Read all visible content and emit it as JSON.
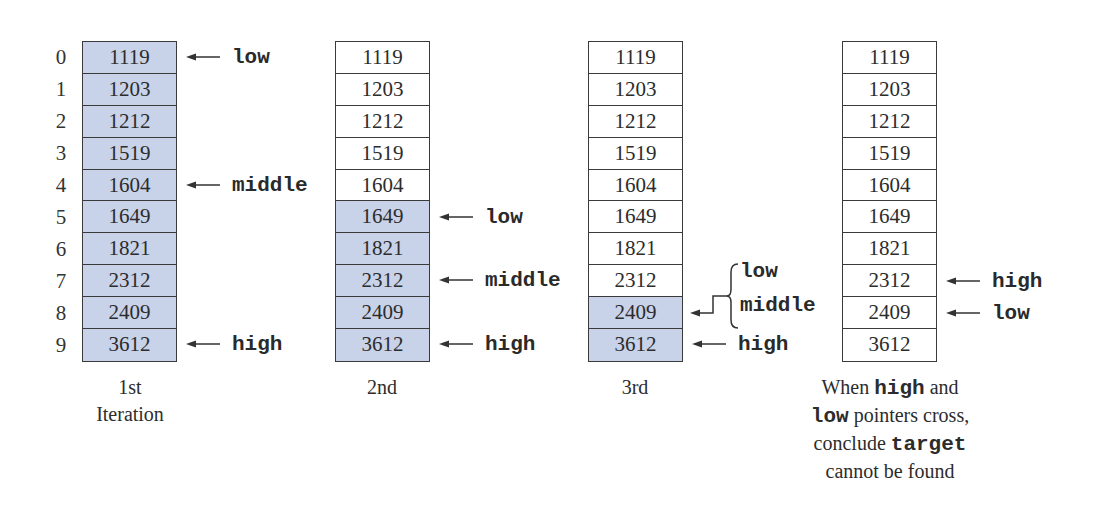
{
  "indices": [
    "0",
    "1",
    "2",
    "3",
    "4",
    "5",
    "6",
    "7",
    "8",
    "9"
  ],
  "colors": {
    "active_fill": "#c8d2e8",
    "border": "#3a3a3a",
    "text": "#2c2c2c"
  },
  "iterations": [
    {
      "caption_line1": "1st",
      "caption_line2": "Iteration",
      "values": [
        "1119",
        "1203",
        "1212",
        "1519",
        "1604",
        "1649",
        "1821",
        "2312",
        "2409",
        "3612"
      ],
      "active_range": [
        0,
        9
      ],
      "pointers": [
        {
          "label": "low",
          "index": 0
        },
        {
          "label": "middle",
          "index": 4
        },
        {
          "label": "high",
          "index": 9
        }
      ]
    },
    {
      "caption_line1": "2nd",
      "values": [
        "1119",
        "1203",
        "1212",
        "1519",
        "1604",
        "1649",
        "1821",
        "2312",
        "2409",
        "3612"
      ],
      "active_range": [
        5,
        9
      ],
      "pointers": [
        {
          "label": "low",
          "index": 5
        },
        {
          "label": "middle",
          "index": 7
        },
        {
          "label": "high",
          "index": 9
        }
      ]
    },
    {
      "caption_line1": "3rd",
      "values": [
        "1119",
        "1203",
        "1212",
        "1519",
        "1604",
        "1649",
        "1821",
        "2312",
        "2409",
        "3612"
      ],
      "active_range": [
        8,
        9
      ],
      "pointers": [
        {
          "label": "low",
          "index": 8,
          "grouped": true
        },
        {
          "label": "middle",
          "index": 8,
          "grouped": true
        },
        {
          "label": "high",
          "index": 9
        }
      ]
    },
    {
      "caption_parts": [
        {
          "text": "When ",
          "mono": false
        },
        {
          "text": "high",
          "mono": true
        },
        {
          "text": " and",
          "mono": false
        },
        {
          "text": "low",
          "mono": true
        },
        {
          "text": " pointers cross,",
          "mono": false
        },
        {
          "text": "conclude ",
          "mono": false
        },
        {
          "text": "target",
          "mono": true
        },
        {
          "text": "cannot be found",
          "mono": false
        }
      ],
      "values": [
        "1119",
        "1203",
        "1212",
        "1519",
        "1604",
        "1649",
        "1821",
        "2312",
        "2409",
        "3612"
      ],
      "active_range": null,
      "pointers": [
        {
          "label": "high",
          "index": 7
        },
        {
          "label": "low",
          "index": 8
        }
      ]
    }
  ]
}
